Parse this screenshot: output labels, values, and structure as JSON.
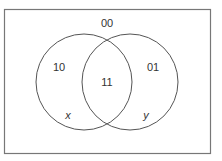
{
  "diagram": {
    "type": "venn",
    "universe_label": "00",
    "sets": [
      {
        "name": "x",
        "only_label": "10"
      },
      {
        "name": "y",
        "only_label": "01"
      }
    ],
    "intersection_label": "11",
    "colors": {
      "stroke": "#555555",
      "text": "#333333",
      "background": "#ffffff"
    }
  }
}
